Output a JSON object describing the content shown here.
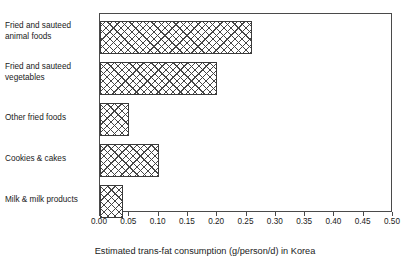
{
  "chart_data": {
    "type": "bar",
    "orientation": "horizontal",
    "title": "",
    "xlabel": "Estimated trans-fat consumption (g/person/d) in Korea",
    "ylabel": "",
    "categories": [
      "Fried and sauteed\nanimal foods",
      "Fried and sauteed\nvegetables",
      "Other fried foods",
      "Cookies & cakes",
      "Milk & milk products"
    ],
    "values": [
      0.26,
      0.2,
      0.05,
      0.1,
      0.04
    ],
    "xlim": [
      0.0,
      0.5
    ],
    "xticks": [
      0.0,
      0.05,
      0.1,
      0.15,
      0.2,
      0.25,
      0.3,
      0.35,
      0.4,
      0.45,
      0.5
    ],
    "xticklabels": [
      "0.00",
      "0.05",
      "0.10",
      "0.15",
      "0.20",
      "0.25",
      "0.30",
      "0.35",
      "0.40",
      "0.45",
      "0.50"
    ],
    "grid": false,
    "legend": false,
    "bar_fill": "crosshatch",
    "bar_edge_color": "#3a3a3a",
    "axis_color": "#4a4a4a",
    "background_color": "#ffffff",
    "text_color": "#1a1a1a"
  }
}
